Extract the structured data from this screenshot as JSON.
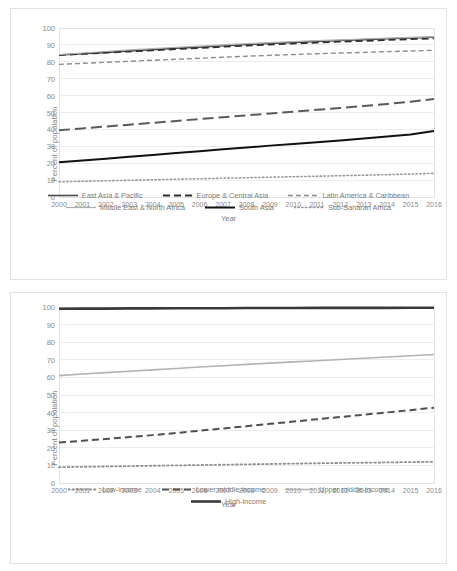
{
  "figure": {
    "panels": [
      "regions",
      "income"
    ]
  },
  "chart_data": [
    {
      "type": "line",
      "title": "",
      "xlabel": "Year",
      "ylabel": "Percent of population",
      "xlim": [
        2000,
        2016
      ],
      "ylim": [
        0,
        100
      ],
      "ytick_step": 10,
      "grid": true,
      "legend_position": "bottom",
      "x": [
        2000,
        2001,
        2002,
        2003,
        2004,
        2005,
        2006,
        2007,
        2008,
        2009,
        2010,
        2011,
        2012,
        2013,
        2014,
        2015,
        2016
      ],
      "yticks": [
        0,
        10,
        20,
        30,
        40,
        50,
        60,
        70,
        80,
        90,
        100
      ],
      "series": [
        {
          "name": "East Asia & Pacific",
          "style": "solid-dot",
          "color": "#4a4a4a",
          "width": 1.6,
          "values": [
            84.0,
            84.8,
            85.6,
            86.4,
            87.2,
            88.0,
            88.7,
            89.5,
            90.2,
            90.9,
            91.5,
            92.1,
            92.6,
            93.1,
            93.6,
            94.1,
            94.6
          ]
        },
        {
          "name": "Europe & Central Asia",
          "style": "dashed",
          "color": "#2e2e2e",
          "width": 1.8,
          "values": [
            84.0,
            84.7,
            85.4,
            86.1,
            86.8,
            87.5,
            88.2,
            88.9,
            89.6,
            90.2,
            90.8,
            91.4,
            91.9,
            92.4,
            92.9,
            93.4,
            93.9
          ]
        },
        {
          "name": "Latin America & Caribbean",
          "style": "dashed-light",
          "color": "#8c8c8c",
          "width": 1.4,
          "values": [
            78.5,
            79.1,
            79.7,
            80.3,
            80.9,
            81.5,
            82.1,
            82.7,
            83.3,
            83.8,
            84.3,
            84.8,
            85.2,
            85.6,
            86.0,
            86.4,
            86.8
          ]
        },
        {
          "name": "Middle East & North Africa",
          "style": "solid-thin",
          "color": "#b0b0b0",
          "width": 1.2,
          "values": [
            84.3,
            85.2,
            86.1,
            87.0,
            87.8,
            88.6,
            89.3,
            90.0,
            90.7,
            91.3,
            91.9,
            92.5,
            93.0,
            93.5,
            94.0,
            94.4,
            94.8
          ]
        },
        {
          "name": "South Asia",
          "style": "solid-thick",
          "color": "#111111",
          "width": 2.0,
          "values": [
            20.5,
            21.6,
            22.7,
            23.8,
            24.9,
            26.0,
            27.1,
            28.2,
            29.3,
            30.4,
            31.4,
            32.4,
            33.5,
            34.6,
            35.8,
            37.0,
            39.0
          ]
        },
        {
          "name": "Sub-Saharan Africa",
          "style": "dotted",
          "color": "#9a9a9a",
          "width": 1.6,
          "values": [
            9.0,
            9.3,
            9.6,
            9.9,
            10.2,
            10.5,
            10.8,
            11.1,
            11.4,
            11.7,
            12.0,
            12.3,
            12.6,
            12.9,
            13.2,
            13.6,
            14.0
          ]
        },
        {
          "name": "Europe-long-dash",
          "style": "long-dash",
          "color": "#5a5a5a",
          "width": 2.0,
          "values": [
            39.5,
            40.6,
            41.7,
            42.8,
            43.9,
            45.0,
            46.1,
            47.2,
            48.3,
            49.4,
            50.5,
            51.6,
            52.7,
            53.8,
            55.0,
            56.4,
            58.0
          ]
        }
      ],
      "legend": [
        {
          "label": "East Asia & Pacific",
          "style": "solid-dot",
          "color": "#4a4a4a"
        },
        {
          "label": "Europe & Central Asia",
          "style": "dashed",
          "color": "#2e2e2e"
        },
        {
          "label": "Latin America & Caribbean",
          "style": "dashed-light",
          "color": "#8c8c8c"
        },
        {
          "label": "Middle East & North Africa",
          "style": "solid-thin",
          "color": "#b0b0b0"
        },
        {
          "label": "South Asia",
          "style": "solid-thick",
          "color": "#111111"
        },
        {
          "label": "Sub-Saharan Africa",
          "style": "dotted",
          "color": "#9a9a9a"
        }
      ]
    },
    {
      "type": "line",
      "title": "",
      "xlabel": "Year",
      "ylabel": "Percent of population",
      "xlim": [
        2000,
        2016
      ],
      "ylim": [
        0,
        100
      ],
      "ytick_step": 10,
      "grid": true,
      "legend_position": "bottom",
      "x": [
        2000,
        2001,
        2002,
        2003,
        2004,
        2005,
        2006,
        2007,
        2008,
        2009,
        2010,
        2011,
        2012,
        2013,
        2014,
        2015,
        2016
      ],
      "yticks": [
        0,
        10,
        20,
        30,
        40,
        50,
        60,
        70,
        80,
        90,
        100
      ],
      "series": [
        {
          "name": "Low-income",
          "style": "dotted",
          "color": "#8f8f8f",
          "width": 1.8,
          "values": [
            9.0,
            9.2,
            9.4,
            9.6,
            9.8,
            10.0,
            10.2,
            10.4,
            10.6,
            10.8,
            11.0,
            11.2,
            11.4,
            11.5,
            11.7,
            11.9,
            12.0
          ]
        },
        {
          "name": "Lower middle-income",
          "style": "dashed",
          "color": "#4f4f4f",
          "width": 2.0,
          "values": [
            23.0,
            24.0,
            25.0,
            26.1,
            27.2,
            28.4,
            29.7,
            31.0,
            32.3,
            33.6,
            34.9,
            36.2,
            37.5,
            38.8,
            40.1,
            41.4,
            42.8
          ]
        },
        {
          "name": "Upper middle-income",
          "style": "solid-thin",
          "color": "#b3b3b3",
          "width": 1.6,
          "values": [
            61.0,
            61.9,
            62.7,
            63.5,
            64.3,
            65.1,
            65.9,
            66.6,
            67.4,
            68.1,
            68.8,
            69.5,
            70.2,
            70.9,
            71.6,
            72.3,
            73.0
          ]
        },
        {
          "name": "High-income",
          "style": "solid-thick",
          "color": "#3a3a3a",
          "width": 2.6,
          "values": [
            99.0,
            99.1,
            99.1,
            99.2,
            99.2,
            99.3,
            99.3,
            99.3,
            99.4,
            99.4,
            99.4,
            99.5,
            99.5,
            99.5,
            99.5,
            99.6,
            99.6
          ]
        }
      ],
      "legend": [
        {
          "label": "Low-income",
          "style": "dotted",
          "color": "#8f8f8f"
        },
        {
          "label": "Lower middle-income",
          "style": "dashed",
          "color": "#4f4f4f"
        },
        {
          "label": "Upper middle-income",
          "style": "solid-thin",
          "color": "#b3b3b3"
        },
        {
          "label": "High-income",
          "style": "solid-thick",
          "color": "#3a3a3a"
        }
      ]
    }
  ]
}
